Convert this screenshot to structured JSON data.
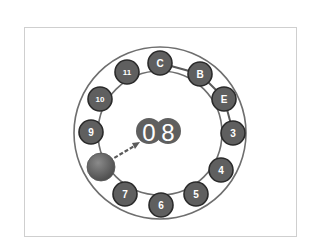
{
  "diagram": {
    "type": "circular-dial",
    "center_display": {
      "digits": [
        "0",
        "8"
      ],
      "value": "08"
    },
    "ring_labels": {
      "c": "C",
      "b": "B",
      "e": "E",
      "n3": "3",
      "n4": "4",
      "n5": "5",
      "n6": "6",
      "n7": "7",
      "n9": "9",
      "n10": "10",
      "n11": "11"
    },
    "connections": [
      "C-B",
      "B-E",
      "E-3"
    ],
    "pointer": {
      "from": "marker-ball",
      "to": "center-display",
      "style": "dashed-arrow"
    },
    "colors": {
      "node_fill": "#5f5f5f",
      "node_stroke": "#2a2a2a",
      "ring_stroke": "#6e6e6e",
      "label_color": "#ffffff",
      "frame_border": "#cfcfcf"
    }
  }
}
